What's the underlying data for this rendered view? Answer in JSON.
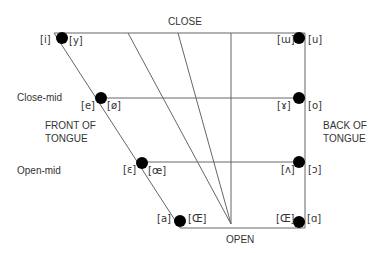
{
  "labels": {
    "close": "CLOSE",
    "open": "OPEN",
    "close_mid": "Close-mid",
    "open_mid": "Open-mid",
    "front_line1": "FRONT OF",
    "front_line2": "TONGUE",
    "back_line1": "BACK OF",
    "back_line2": "TONGUE"
  },
  "vowels": {
    "close_front_unrounded": "[i]",
    "close_front_rounded": "[y]",
    "close_back_unrounded": "[ɯ]",
    "close_back_rounded": "[u]",
    "closemid_front_unrounded": "[e]",
    "closemid_front_rounded": "[ø]",
    "closemid_back_unrounded": "[ɤ]",
    "closemid_back_rounded": "[o]",
    "openmid_front_unrounded": "[ɛ]",
    "openmid_front_rounded": "[œ]",
    "openmid_back_unrounded": "[ʌ]",
    "openmid_back_rounded": "[ɔ]",
    "open_front_unrounded": "[a]",
    "open_front_rounded": "[Œ]",
    "open_back_unrounded": "[Œ]",
    "open_back_rounded": "[ɑ]"
  },
  "colors": {
    "line": "#555555",
    "dot": "#000000"
  }
}
